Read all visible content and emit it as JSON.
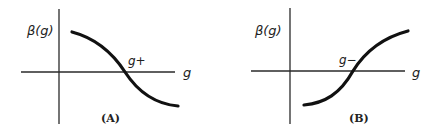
{
  "figure": {
    "panels": [
      {
        "id": "A",
        "panel_label": "(A)",
        "y_axis_label": "β(g)",
        "x_axis_label": "g",
        "fixed_point_label": "g+",
        "curve_shape": "decreasing sigmoid crossing zero at g+"
      },
      {
        "id": "B",
        "panel_label": "(B)",
        "y_axis_label": "β(g)",
        "x_axis_label": "g",
        "fixed_point_label": "g−",
        "curve_shape": "increasing sigmoid crossing zero at g−"
      }
    ],
    "colors": {
      "background": "#ffffff",
      "ink": "#111111"
    }
  }
}
